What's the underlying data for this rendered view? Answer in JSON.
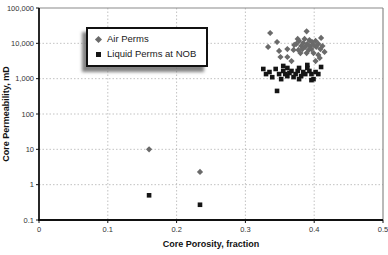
{
  "chart_data": {
    "type": "scatter",
    "title": "",
    "xlabel": "Core Porosity, fraction",
    "ylabel": "Core Permeability, mD",
    "x_scale": "linear",
    "y_scale": "log",
    "xlim": [
      0,
      0.5
    ],
    "ylim": [
      0.1,
      100000
    ],
    "grid": true,
    "x_ticks": [
      0,
      0.1,
      0.2,
      0.3,
      0.4,
      0.5
    ],
    "x_tick_labels": [
      "0",
      "0.1",
      "0.2",
      "0.3",
      "0.4",
      "0.5"
    ],
    "y_ticks": [
      0.1,
      1,
      10,
      100,
      1000,
      10000,
      100000
    ],
    "y_tick_labels": [
      "0.1",
      "1",
      "10",
      "100",
      "1,000",
      "10,000",
      "100,000"
    ],
    "legend": {
      "position": "upper-left-inside"
    },
    "colors": {
      "air_marker": "#6a6a6a",
      "liquid_marker": "#151515",
      "gridline": "#b3b3b3",
      "axis": "#111111",
      "frame": "#8a8a8a"
    },
    "series": [
      {
        "name": "Air Perms",
        "marker": "diamond",
        "color": "#6a6a6a",
        "points": [
          [
            0.336,
            19600
          ],
          [
            0.346,
            10900
          ],
          [
            0.333,
            7900
          ],
          [
            0.349,
            6100
          ],
          [
            0.361,
            6900
          ],
          [
            0.37,
            6500
          ],
          [
            0.361,
            4100
          ],
          [
            0.367,
            3150
          ],
          [
            0.351,
            4100
          ],
          [
            0.374,
            9600
          ],
          [
            0.378,
            11700
          ],
          [
            0.381,
            8400
          ],
          [
            0.384,
            10200
          ],
          [
            0.387,
            7900
          ],
          [
            0.389,
            21900
          ],
          [
            0.39,
            9600
          ],
          [
            0.393,
            12400
          ],
          [
            0.394,
            8400
          ],
          [
            0.397,
            10900
          ],
          [
            0.399,
            9000
          ],
          [
            0.402,
            11700
          ],
          [
            0.403,
            7900
          ],
          [
            0.406,
            9600
          ],
          [
            0.406,
            4700
          ],
          [
            0.402,
            3150
          ],
          [
            0.409,
            6900
          ],
          [
            0.412,
            8400
          ],
          [
            0.415,
            5700
          ],
          [
            0.41,
            14200
          ],
          [
            0.377,
            6500
          ],
          [
            0.371,
            9000
          ],
          [
            0.383,
            6900
          ],
          [
            0.392,
            6500
          ],
          [
            0.396,
            6900
          ],
          [
            0.376,
            13300
          ],
          [
            0.386,
            13300
          ],
          [
            0.38,
            5300
          ],
          [
            0.389,
            5300
          ],
          [
            0.399,
            5300
          ],
          [
            0.408,
            3850
          ],
          [
            0.16,
            10
          ],
          [
            0.234,
            2.3
          ]
        ]
      },
      {
        "name": "Liquid Perms at NOB",
        "marker": "square",
        "color": "#151515",
        "points": [
          [
            0.326,
            1880
          ],
          [
            0.335,
            1540
          ],
          [
            0.344,
            1880
          ],
          [
            0.349,
            1350
          ],
          [
            0.355,
            1650
          ],
          [
            0.361,
            1180
          ],
          [
            0.367,
            1650
          ],
          [
            0.373,
            1350
          ],
          [
            0.378,
            2010
          ],
          [
            0.384,
            1540
          ],
          [
            0.39,
            2010
          ],
          [
            0.396,
            1350
          ],
          [
            0.399,
            970
          ],
          [
            0.39,
            2440
          ],
          [
            0.41,
            2140
          ],
          [
            0.346,
            450
          ],
          [
            0.33,
            1350
          ],
          [
            0.339,
            1100
          ],
          [
            0.352,
            970
          ],
          [
            0.358,
            1350
          ],
          [
            0.364,
            1450
          ],
          [
            0.37,
            1110
          ],
          [
            0.376,
            1650
          ],
          [
            0.381,
            1180
          ],
          [
            0.387,
            1350
          ],
          [
            0.393,
            1650
          ],
          [
            0.402,
            1540
          ],
          [
            0.406,
            1350
          ],
          [
            0.396,
            910
          ],
          [
            0.378,
            970
          ],
          [
            0.361,
            2010
          ],
          [
            0.355,
            2290
          ],
          [
            0.16,
            0.5
          ],
          [
            0.234,
            0.27
          ]
        ]
      }
    ]
  }
}
